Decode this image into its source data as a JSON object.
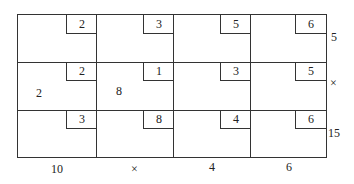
{
  "table": {
    "rows": [
      {
        "cells": [
          {
            "cost": "2",
            "allocation": ""
          },
          {
            "cost": "3",
            "allocation": ""
          },
          {
            "cost": "5",
            "allocation": ""
          },
          {
            "cost": "6",
            "allocation": ""
          }
        ],
        "supply": "5"
      },
      {
        "cells": [
          {
            "cost": "2",
            "allocation": "2"
          },
          {
            "cost": "1",
            "allocation": "8"
          },
          {
            "cost": "3",
            "allocation": ""
          },
          {
            "cost": "5",
            "allocation": ""
          }
        ],
        "supply": "×"
      },
      {
        "cells": [
          {
            "cost": "3",
            "allocation": ""
          },
          {
            "cost": "8",
            "allocation": ""
          },
          {
            "cost": "4",
            "allocation": ""
          },
          {
            "cost": "6",
            "allocation": ""
          }
        ],
        "supply": "15"
      }
    ],
    "demand": [
      "10",
      "×",
      "4",
      "6"
    ]
  }
}
